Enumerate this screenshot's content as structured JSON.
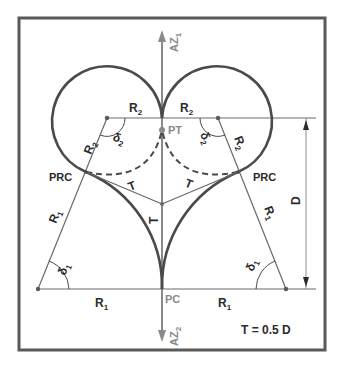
{
  "diagram": {
    "colors": {
      "frame": "#5a5a5a",
      "curve": "#4a4a4a",
      "thin_line": "#6a6a6a",
      "axis": "#8a8a8a",
      "text": "#2b2b2b",
      "axis_text": "#8a8a8a"
    },
    "labels": {
      "az1": "AZ",
      "az1_sub": "1",
      "az2": "AZ",
      "az2_sub": "2",
      "pt": "PT",
      "pc": "PC",
      "prc_left": "PRC",
      "prc_right": "PRC",
      "r2_top_left": "R",
      "r2_top_left_sub": "2",
      "r2_top_right": "R",
      "r2_top_right_sub": "2",
      "r2_radial_left": "R",
      "r2_radial_left_sub": "2",
      "r2_radial_right": "R",
      "r2_radial_right_sub": "2",
      "r1_radial_left": "R",
      "r1_radial_left_sub": "1",
      "r1_radial_right": "R",
      "r1_radial_right_sub": "1",
      "r1_bottom_left": "R",
      "r1_bottom_left_sub": "1",
      "r1_bottom_right": "R",
      "r1_bottom_right_sub": "1",
      "delta2_left": "δ",
      "delta2_left_sub": "2",
      "delta2_right": "δ",
      "delta2_right_sub": "2",
      "delta1_left": "δ",
      "delta1_left_sub": "1",
      "delta1_right": "δ",
      "delta1_right_sub": "1",
      "t_left": "T",
      "t_right": "T",
      "t_vertical": "T",
      "d_dimension": "D",
      "formula": "T = 0.5 D"
    }
  }
}
